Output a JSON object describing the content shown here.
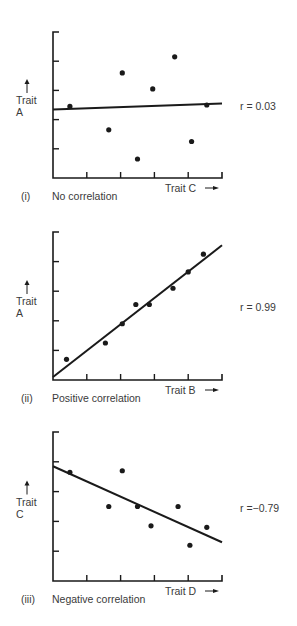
{
  "chart_data": [
    {
      "type": "scatter",
      "panel": "(i)",
      "caption": "No correlation",
      "xlabel": "Trait C",
      "ylabel": [
        "Trait",
        "A"
      ],
      "r_label": "r = 0.03",
      "r": 0.03,
      "grid": false,
      "xlim": [
        0,
        5
      ],
      "ylim": [
        0,
        5
      ],
      "x_ticks": 5,
      "y_ticks": 5,
      "points": [
        {
          "x": 0.5,
          "y": 2.45
        },
        {
          "x": 1.65,
          "y": 1.65
        },
        {
          "x": 2.05,
          "y": 3.6
        },
        {
          "x": 2.5,
          "y": 0.65
        },
        {
          "x": 2.95,
          "y": 3.05
        },
        {
          "x": 3.6,
          "y": 4.15
        },
        {
          "x": 4.1,
          "y": 1.25
        },
        {
          "x": 4.55,
          "y": 2.5
        }
      ],
      "fit_line": {
        "x1": 0,
        "y1": 2.35,
        "x2": 5,
        "y2": 2.55
      }
    },
    {
      "type": "scatter",
      "panel": "(ii)",
      "caption": "Positive correlation",
      "xlabel": "Trait B",
      "ylabel": [
        "Trait",
        "A"
      ],
      "r_label": "r = 0.99",
      "r": 0.99,
      "grid": false,
      "xlim": [
        0,
        5
      ],
      "ylim": [
        0,
        5
      ],
      "x_ticks": 5,
      "y_ticks": 5,
      "points": [
        {
          "x": 0.4,
          "y": 0.7
        },
        {
          "x": 1.55,
          "y": 1.25
        },
        {
          "x": 2.05,
          "y": 1.9
        },
        {
          "x": 2.45,
          "y": 2.55
        },
        {
          "x": 2.85,
          "y": 2.55
        },
        {
          "x": 3.55,
          "y": 3.1
        },
        {
          "x": 4.0,
          "y": 3.65
        },
        {
          "x": 4.45,
          "y": 4.25
        }
      ],
      "fit_line": {
        "x1": 0,
        "y1": 0.1,
        "x2": 5,
        "y2": 4.55
      }
    },
    {
      "type": "scatter",
      "panel": "(iii)",
      "caption": "Negative correlation",
      "xlabel": "Trait D",
      "ylabel": [
        "Trait",
        "C"
      ],
      "r_label": "r =−0.79",
      "r": -0.79,
      "grid": false,
      "xlim": [
        0,
        5
      ],
      "ylim": [
        0,
        5
      ],
      "x_ticks": 5,
      "y_ticks": 5,
      "points": [
        {
          "x": 0.5,
          "y": 3.65
        },
        {
          "x": 1.65,
          "y": 2.5
        },
        {
          "x": 2.05,
          "y": 3.7
        },
        {
          "x": 2.5,
          "y": 2.5
        },
        {
          "x": 2.9,
          "y": 1.85
        },
        {
          "x": 3.7,
          "y": 2.5
        },
        {
          "x": 4.05,
          "y": 1.2
        },
        {
          "x": 4.55,
          "y": 1.8
        }
      ],
      "fit_line": {
        "x1": 0,
        "y1": 3.85,
        "x2": 5,
        "y2": 1.3
      }
    }
  ],
  "colors": {
    "ink": "#1a1a1a",
    "text": "#3a3a3a",
    "background": "#ffffff"
  }
}
